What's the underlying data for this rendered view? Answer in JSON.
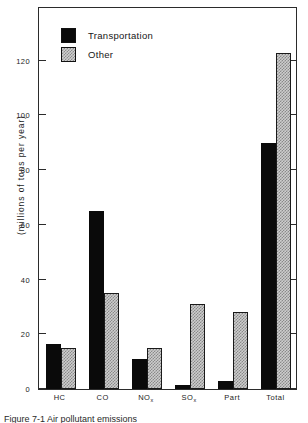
{
  "chart_data": {
    "type": "bar",
    "title": "",
    "xlabel": "",
    "ylabel": "(millions of tons per year)",
    "ylim": [
      0,
      140
    ],
    "yticks": [
      0,
      20,
      40,
      60,
      80,
      100,
      120
    ],
    "ytick_labels": [
      "0",
      "20",
      "40",
      "60",
      "80",
      "100",
      "120"
    ],
    "grid": false,
    "legend_position": "upper-left inside axes",
    "categories": [
      "HC",
      "CO",
      "NO",
      "SO",
      "Part",
      "Total"
    ],
    "category_labels": [
      {
        "base": "HC",
        "sub": ""
      },
      {
        "base": "CO",
        "sub": ""
      },
      {
        "base": "NO",
        "sub": "x"
      },
      {
        "base": "SO",
        "sub": "x"
      },
      {
        "base": "Part",
        "sub": ""
      },
      {
        "base": "Total",
        "sub": ""
      }
    ],
    "series": [
      {
        "name": "Transportation",
        "fill": "solid-black",
        "color": "#0a0a0a",
        "values": [
          16.5,
          65,
          11,
          1.5,
          3,
          90
        ]
      },
      {
        "name": "Other",
        "fill": "checkered-gray",
        "color": "#cdcdcd",
        "values": [
          15,
          35,
          15,
          31,
          28,
          123
        ]
      }
    ]
  },
  "legend": {
    "items": [
      {
        "label": "Transportation",
        "swatch": "solid"
      },
      {
        "label": "Other",
        "swatch": "hatch"
      }
    ]
  },
  "axes": {
    "y_title": "(millions of tons per year)"
  },
  "caption": {
    "text": "Figure  7-1  Air pollutant emissions"
  }
}
